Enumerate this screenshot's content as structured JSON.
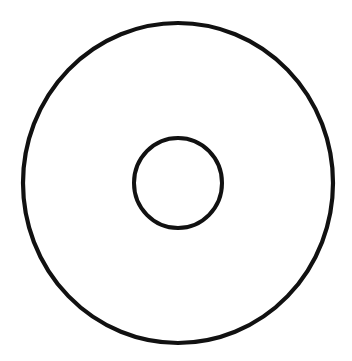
{
  "figure": {
    "title": "Radial sunburst wheel diagram",
    "background_color": "#ffffff",
    "stroke_color": "#111111",
    "fill_color": "#ffffff"
  },
  "canvas": {
    "width": 352,
    "height": 361
  },
  "outer_circle": {
    "name": "outer-ring",
    "center_x": 178,
    "center_y": 183,
    "radius_x": 155,
    "radius_y": 160,
    "stroke_width": 4.2
  },
  "inner_circle": {
    "name": "hub-circle",
    "center_x": 178,
    "center_y": 183,
    "radius_x": 44,
    "radius_y": 45,
    "stroke_width": 4.0
  },
  "chart_data": {
    "type": "pie",
    "title": "Radial sunburst wheel diagram",
    "xlabel": "",
    "ylabel": "",
    "legend_position": "none",
    "grid": false,
    "center": [
      178,
      183
    ],
    "inner_radius": 44,
    "outer_radius": 155,
    "sector_count": 24,
    "spoke_count": 24,
    "spoke_stroke_width": 1.7,
    "note": "Spokes are unequally spaced: narrow sectors on the left half, progressively wider sectors on the right half.",
    "spoke_angles_deg": [
      0,
      18,
      37,
      55,
      72,
      86,
      99,
      110,
      121,
      132,
      143,
      154,
      165,
      180,
      192,
      203,
      214,
      225,
      236,
      247,
      259,
      274,
      293,
      316,
      338
    ],
    "categories": [
      "s01",
      "s02",
      "s03",
      "s04",
      "s05",
      "s06",
      "s07",
      "s08",
      "s09",
      "s10",
      "s11",
      "s12",
      "s13",
      "s14",
      "s15",
      "s16",
      "s17",
      "s18",
      "s19",
      "s20",
      "s21",
      "s22",
      "s23",
      "s24"
    ],
    "values": [
      18,
      19,
      18,
      17,
      14,
      13,
      11,
      11,
      11,
      11,
      11,
      11,
      15,
      12,
      11,
      11,
      11,
      11,
      11,
      12,
      15,
      19,
      23,
      22
    ]
  }
}
